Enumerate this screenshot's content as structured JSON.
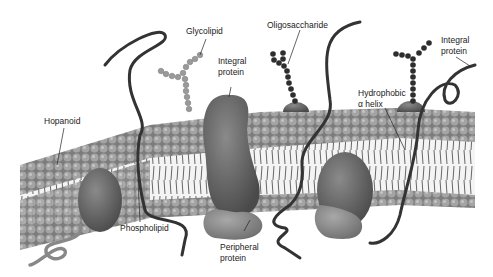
{
  "diagram": {
    "labels": {
      "glycolipid": "Glycolipid",
      "integral_protein_center_1": "Integral",
      "integral_protein_center_2": "protein",
      "oligosaccharide": "Oligosaccharide",
      "integral_protein_right_1": "Integral",
      "integral_protein_right_2": "protein",
      "hopanoid": "Hopanoid",
      "hydrophobic_1": "Hydrophobic",
      "hydrophobic_2": "α helix",
      "phospholipid": "Phospholipid",
      "peripheral_1": "Peripheral",
      "peripheral_2": "protein"
    },
    "colors": {
      "head_group": "#9a9a9a",
      "head_group_dark": "#6e6e6e",
      "protein_dark": "#5a5a5a",
      "protein_light": "#8a8a8a",
      "chain_dark": "#2e2e2e",
      "tail": "#444444",
      "label_text": "#222222"
    }
  }
}
